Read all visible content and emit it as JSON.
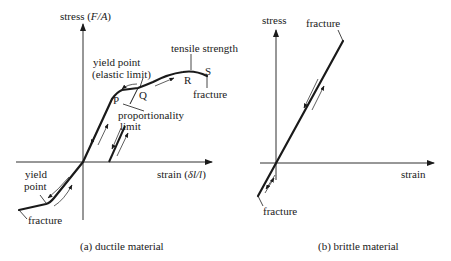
{
  "figure": {
    "panel_a": {
      "caption": "(a) ductile material",
      "y_axis_label": "stress (F/A)",
      "y_axis_label_parts": {
        "prefix": "stress (",
        "var": "F/A",
        "suffix": ")"
      },
      "x_axis_label": "strain (δl/l)",
      "x_axis_label_parts": {
        "prefix": "strain (",
        "var": "δl/l",
        "suffix": ")"
      },
      "annotations": {
        "tensile_strength": "tensile strength",
        "yield_point_line1": "yield point",
        "yield_point_line2": "(elastic limit)",
        "point_P": "P",
        "point_Q": "Q",
        "point_R": "R",
        "point_S": "S",
        "fracture_top": "fracture",
        "proportionality_line1": "proportionality",
        "proportionality_line2": "limit",
        "yield_point_neg_line1": "yield",
        "yield_point_neg_line2": "point",
        "fracture_bottom": "fracture"
      }
    },
    "panel_b": {
      "caption": "(b) brittle material",
      "y_axis_label": "stress",
      "x_axis_label": "strain",
      "annotations": {
        "fracture_top": "fracture",
        "fracture_bottom": "fracture"
      }
    },
    "colors": {
      "ink": "#1a1a1a",
      "background": "#ffffff"
    }
  }
}
